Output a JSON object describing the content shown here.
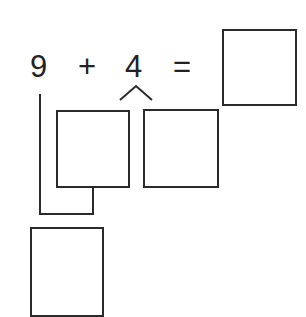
{
  "equation": {
    "operand1": "9",
    "operator": "+",
    "operand2": "4",
    "equals": "=",
    "answer": ""
  },
  "split_boxes": {
    "part1": "",
    "part2": ""
  },
  "combined_box": "",
  "colors": {
    "stroke": "#2a2a2a",
    "background": "#ffffff"
  }
}
